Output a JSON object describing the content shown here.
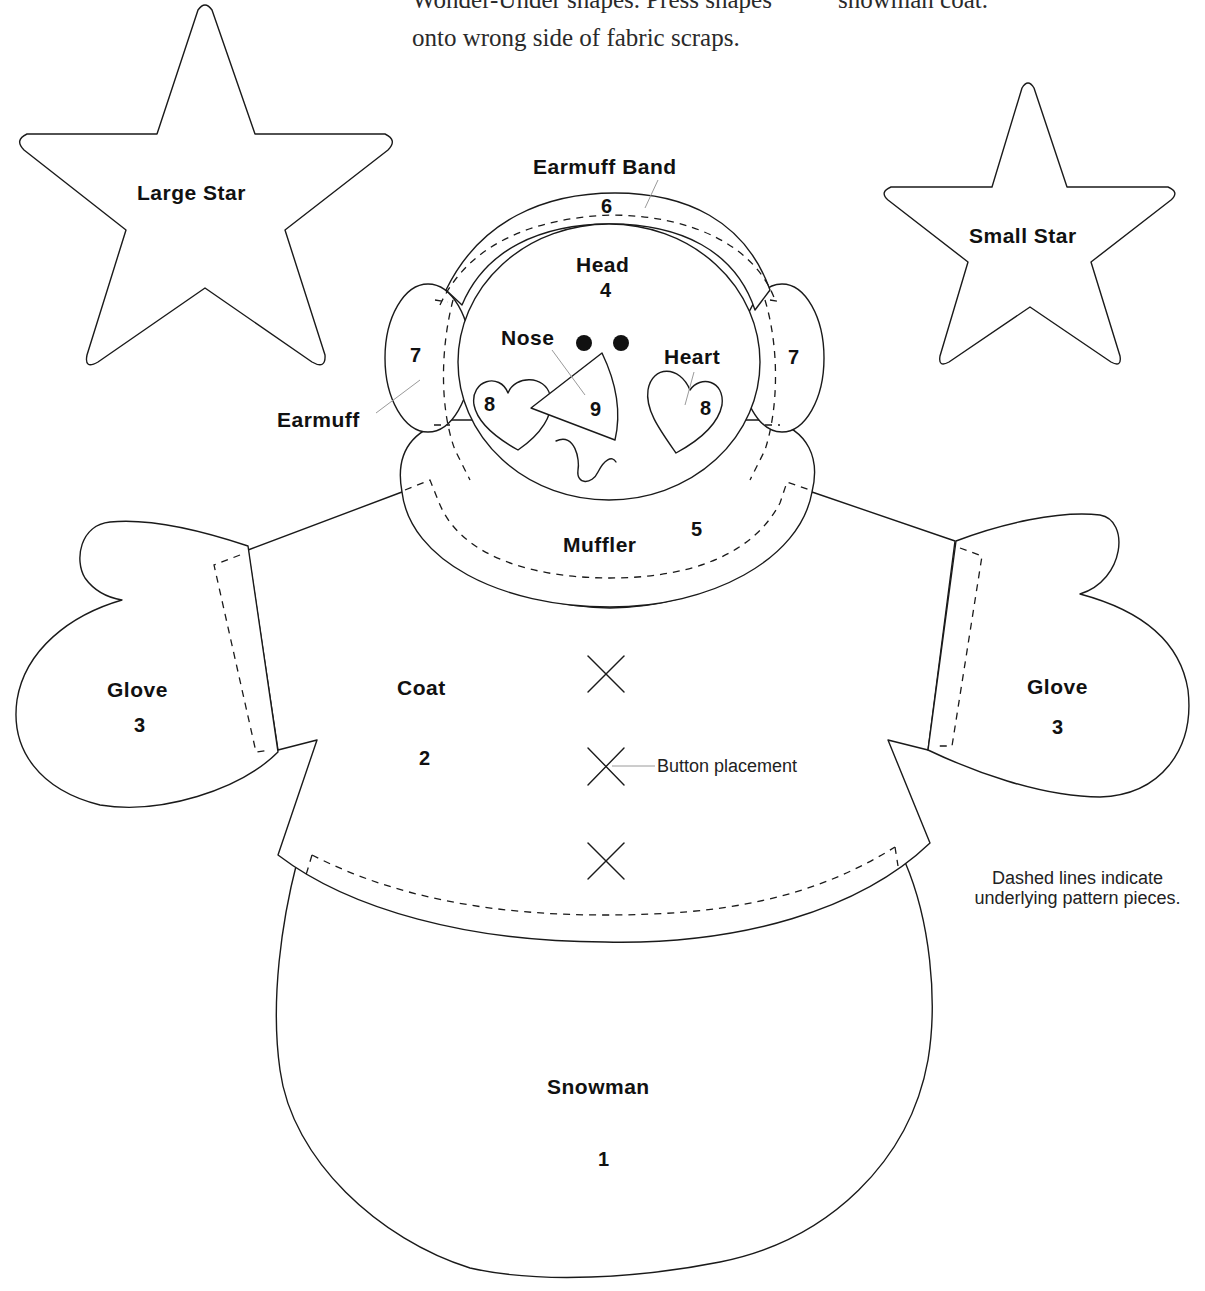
{
  "instructions": {
    "line1_left": "Wonder-Under shapes. Press shapes",
    "line1_right": "snowman coat.",
    "line2": "onto wrong side of fabric scraps."
  },
  "pieces": {
    "large_star": {
      "label": "Large Star"
    },
    "small_star": {
      "label": "Small Star"
    },
    "earmuff_band": {
      "label": "Earmuff Band",
      "number": "6"
    },
    "head": {
      "label": "Head",
      "number": "4"
    },
    "earmuff_left": {
      "number": "7"
    },
    "earmuff_right": {
      "number": "7"
    },
    "earmuff_label": "Earmuff",
    "nose": {
      "label": "Nose",
      "number": "9"
    },
    "heart_left": {
      "number": "8"
    },
    "heart_right": {
      "label": "Heart",
      "number": "8"
    },
    "muffler": {
      "label": "Muffler",
      "number": "5"
    },
    "glove_left": {
      "label": "Glove",
      "number": "3"
    },
    "glove_right": {
      "label": "Glove",
      "number": "3"
    },
    "coat": {
      "label": "Coat",
      "number": "2"
    },
    "snowman": {
      "label": "Snowman",
      "number": "1"
    }
  },
  "annotations": {
    "button_placement": "Button placement",
    "dashed_note_line1": "Dashed lines indicate",
    "dashed_note_line2": "underlying pattern pieces."
  },
  "colors": {
    "line": "#1a1a1a",
    "leader": "#9a9a9a",
    "background": "#ffffff"
  }
}
